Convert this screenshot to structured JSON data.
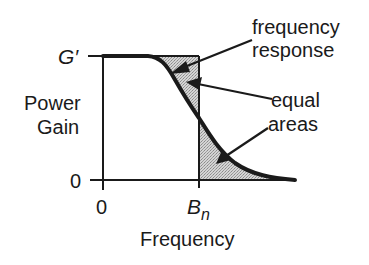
{
  "diagram": {
    "y_axis": {
      "label_line1": "Power",
      "label_line2": "Gain",
      "tick_top": "G′",
      "tick_bottom": "0"
    },
    "x_axis": {
      "label": "Frequency",
      "tick_origin": "0",
      "tick_bn_main": "B",
      "tick_bn_sub": "n"
    },
    "annotations": {
      "frequency_response_line1": "frequency",
      "frequency_response_line2": "response",
      "equal_areas_line1": "equal",
      "equal_areas_line2": "areas"
    },
    "colors": {
      "ink": "#1a1a1a",
      "shade": "#c8c8c8"
    }
  }
}
